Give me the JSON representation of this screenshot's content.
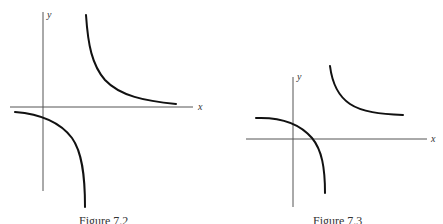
{
  "figures": [
    {
      "caption": "Figure 7.2",
      "x_axis_label": "x",
      "y_axis_label": "y",
      "description": "Rectangular hyperbola centered at origin-ish: branch in upper-right quadrant approaching x-axis, branch in lower-left crossing y-axis and descending steeply"
    },
    {
      "caption": "Figure 7.3",
      "x_axis_label": "x",
      "y_axis_label": "y",
      "description": "Shifted hyperbola: upper-right branch approaching horizontal asymptote above x-axis, lower-left branch crossing both axes and descending steeply"
    }
  ]
}
